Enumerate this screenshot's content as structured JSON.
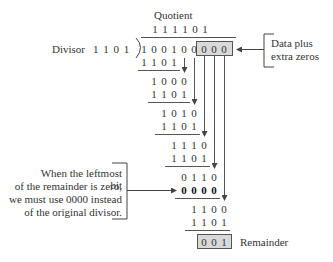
{
  "diagram": {
    "title_label": "Quotient",
    "quotient": [
      "1",
      "1",
      "1",
      "1",
      "0",
      "1"
    ],
    "divisor_label": "Divisor",
    "divisor": "1 1 0 1",
    "dividend": [
      "1",
      "0",
      "0",
      "1",
      "0",
      "0"
    ],
    "extra_zeros": [
      "0",
      "0",
      "0"
    ],
    "steps": [
      {
        "digits": [
          "1",
          "1",
          "0",
          "1"
        ],
        "start_col": 0,
        "bold": false,
        "underline": true
      },
      {
        "digits": [
          "1",
          "0",
          "0",
          "0"
        ],
        "start_col": 1,
        "bold": false,
        "underline": false
      },
      {
        "digits": [
          "1",
          "1",
          "0",
          "1"
        ],
        "start_col": 1,
        "bold": false,
        "underline": true
      },
      {
        "digits": [
          "1",
          "0",
          "1",
          "0"
        ],
        "start_col": 2,
        "bold": false,
        "underline": false
      },
      {
        "digits": [
          "1",
          "1",
          "0",
          "1"
        ],
        "start_col": 2,
        "bold": false,
        "underline": true
      },
      {
        "digits": [
          "1",
          "1",
          "1",
          "0"
        ],
        "start_col": 3,
        "bold": false,
        "underline": false
      },
      {
        "digits": [
          "1",
          "1",
          "0",
          "1"
        ],
        "start_col": 3,
        "bold": false,
        "underline": true
      },
      {
        "digits": [
          "0",
          "1",
          "1",
          "0"
        ],
        "start_col": 4,
        "bold": false,
        "underline": false
      },
      {
        "digits": [
          "0",
          "0",
          "0",
          "0"
        ],
        "start_col": 4,
        "bold": true,
        "underline": true
      },
      {
        "digits": [
          "1",
          "1",
          "0",
          "0"
        ],
        "start_col": 5,
        "bold": false,
        "underline": false
      },
      {
        "digits": [
          "1",
          "1",
          "0",
          "1"
        ],
        "start_col": 5,
        "bold": false,
        "underline": true
      }
    ],
    "remainder": [
      "0",
      "0",
      "1"
    ],
    "remainder_label": "Remainder",
    "callout_data": [
      "Data plus",
      "extra zeros"
    ],
    "callout_zero": [
      "When the leftmost bit",
      "of the remainder is zero,",
      "we must use 0000 instead",
      "of the original divisor."
    ]
  },
  "colors": {
    "box_fill": "#d9d9d9",
    "line": "#555555",
    "text": "#333333"
  }
}
